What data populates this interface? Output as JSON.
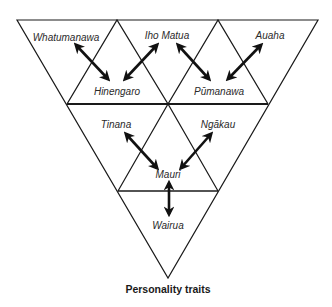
{
  "diagram": {
    "caption": "Personality traits",
    "colors": {
      "line": "#1a1a1a",
      "arrow": "#111111",
      "background": "#ffffff"
    },
    "nodes": {
      "whatumanawa": "Whatumanawa",
      "iho_matua": "Iho Matua",
      "auaha": "Auaha",
      "hinengaro": "Hinengaro",
      "pumanawa": "Pūmanawa",
      "tinana": "Tinana",
      "ngakau": "Ngākau",
      "mauri": "Mauri",
      "wairua": "Wairua"
    },
    "connections": [
      {
        "from": "Whatumanawa",
        "to": "Hinengaro",
        "type": "bidirectional"
      },
      {
        "from": "Iho Matua",
        "to": "Hinengaro",
        "type": "bidirectional"
      },
      {
        "from": "Iho Matua",
        "to": "Pūmanawa",
        "type": "bidirectional"
      },
      {
        "from": "Auaha",
        "to": "Pūmanawa",
        "type": "bidirectional"
      },
      {
        "from": "Tinana",
        "to": "Mauri",
        "type": "bidirectional"
      },
      {
        "from": "Ngākau",
        "to": "Mauri",
        "type": "bidirectional"
      },
      {
        "from": "Wairua",
        "to": "Mauri",
        "type": "bidirectional"
      }
    ]
  }
}
